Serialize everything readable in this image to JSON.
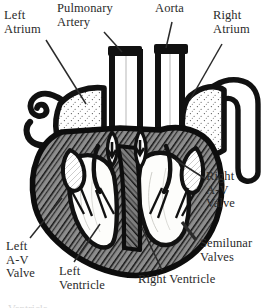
{
  "figure": {
    "view": "anterior coronal section",
    "style": "black and white engraved line drawing",
    "background_color": "#ffffff",
    "ink_color": "#1a1a1a",
    "label_text_color": "#2b2b2b"
  },
  "labels": {
    "left_atrium": "Left\nAtrium",
    "pulmonary_artery": "Pulmonary\nArtery",
    "aorta": "Aorta",
    "right_atrium": "Right\nAtrium",
    "right_av_valve": "Right\nA-V\nValve",
    "semilunar_valves": "Semilunar\nValves",
    "left_av_valve": "Left\nA-V\nValve",
    "left_ventricle": "Left\nVentricle",
    "right_ventricle": "Right Ventricle"
  },
  "caption": {
    "cut_off_line": "Ventricle"
  },
  "structures": [
    {
      "name": "left-atrium",
      "label": "Left Atrium",
      "fill": "stippled",
      "description": "upper left chamber with dotted stipple shading"
    },
    {
      "name": "right-atrium",
      "label": "Right Atrium",
      "fill": "stippled",
      "description": "upper right chamber with dotted stipple shading"
    },
    {
      "name": "left-ventricle",
      "label": "Left Ventricle",
      "fill": "white",
      "description": "lower left cavity, white with fine contour lines"
    },
    {
      "name": "right-ventricle",
      "label": "Right Ventricle",
      "fill": "white",
      "description": "lower right cavity, white with fine contour lines"
    },
    {
      "name": "myocardium",
      "label": "Heart muscle wall",
      "fill": "cross-hatched",
      "description": "thick cross-hatched muscular wall surrounding ventricles"
    },
    {
      "name": "aorta",
      "label": "Aorta",
      "fill": "white-lumen",
      "description": "great vessel rising from left ventricle, thick black walls"
    },
    {
      "name": "pulmonary-artery",
      "label": "Pulmonary Artery",
      "fill": "white-lumen",
      "description": "great vessel rising from right ventricle, thick black walls"
    },
    {
      "name": "vena-cava",
      "label": "Vena cava",
      "fill": "white-lumen",
      "description": "wide vessel entering right atrium from the right side"
    },
    {
      "name": "pulmonary-veins",
      "label": "Pulmonary veins",
      "fill": "white-lumen",
      "description": "hooked vessels entering left atrium from upper left"
    },
    {
      "name": "left-av-valve",
      "label": "Left A-V Valve",
      "fill": "white",
      "description": "bicuspid valve leaflets with chordae tendineae"
    },
    {
      "name": "right-av-valve",
      "label": "Right A-V Valve",
      "fill": "white",
      "description": "tricuspid valve leaflets with chordae tendineae"
    },
    {
      "name": "semilunar-valves",
      "label": "Semilunar Valves",
      "fill": "white",
      "description": "cusps at the base of aorta and pulmonary artery"
    },
    {
      "name": "interventricular-septum",
      "label": "Septum",
      "fill": "cross-hatched",
      "description": "cross-hatched wall dividing the two ventricles"
    },
    {
      "name": "flow-arrows",
      "label": "Blood flow arrows",
      "fill": "solid-black",
      "description": "two small solid arrows marking blood flow direction"
    }
  ]
}
